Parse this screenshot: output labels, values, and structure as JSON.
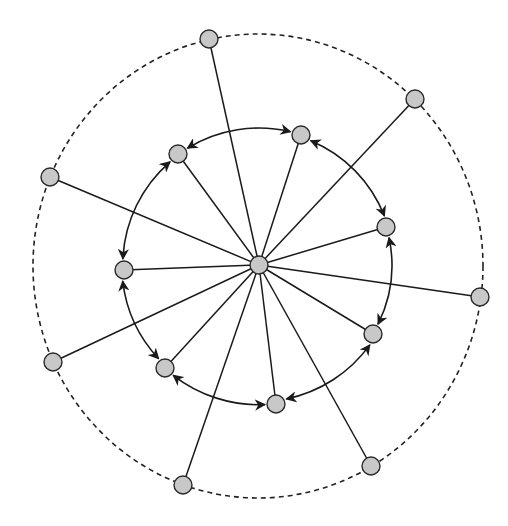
{
  "diagram": {
    "type": "star-ring-network",
    "colors": {
      "node_fill": "#c8c8c8",
      "node_stroke": "#2a2a2a",
      "line": "#1a1a1a",
      "background": "#ffffff"
    },
    "node_radius": 9,
    "center": {
      "id": "hub",
      "x": 259,
      "y": 265
    },
    "outer_ring": {
      "cx": 258,
      "cy": 266,
      "rx": 225,
      "ry": 232,
      "style": "dashed"
    },
    "inner_nodes": [
      {
        "id": "i1",
        "x": 301,
        "y": 135
      },
      {
        "id": "i2",
        "x": 386,
        "y": 227
      },
      {
        "id": "i3",
        "x": 373,
        "y": 334
      },
      {
        "id": "i4",
        "x": 276,
        "y": 404
      },
      {
        "id": "i5",
        "x": 165,
        "y": 368
      },
      {
        "id": "i6",
        "x": 124,
        "y": 270
      },
      {
        "id": "i7",
        "x": 178,
        "y": 154
      }
    ],
    "outer_nodes": [
      {
        "id": "o1",
        "x": 209,
        "y": 39
      },
      {
        "id": "o2",
        "x": 415,
        "y": 99
      },
      {
        "id": "o3",
        "x": 480,
        "y": 297
      },
      {
        "id": "o4",
        "x": 371,
        "y": 466
      },
      {
        "id": "o5",
        "x": 183,
        "y": 485
      },
      {
        "id": "o6",
        "x": 53,
        "y": 362
      },
      {
        "id": "o7",
        "x": 50,
        "y": 177
      }
    ],
    "ring_links": [
      {
        "from": "i7",
        "to": "i1",
        "arrows": "both"
      },
      {
        "from": "i1",
        "to": "i2",
        "arrows": "both"
      },
      {
        "from": "i2",
        "to": "i3",
        "arrows": "both"
      },
      {
        "from": "i3",
        "to": "i4",
        "arrows": "both"
      },
      {
        "from": "i4",
        "to": "i5",
        "arrows": "both"
      },
      {
        "from": "i5",
        "to": "i6",
        "arrows": "both"
      },
      {
        "from": "i6",
        "to": "i7",
        "arrows": "both"
      }
    ],
    "spokes": "hub connects to every inner and outer node with a straight line"
  }
}
